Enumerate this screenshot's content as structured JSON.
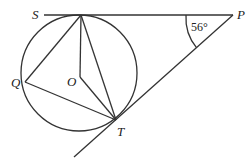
{
  "diagram": {
    "type": "circle-geometry",
    "points": {
      "S": "S",
      "P": "P",
      "Q": "Q",
      "O": "O",
      "T": "T"
    },
    "angle_label": "56°",
    "angle_at": "P",
    "segments": [
      "SP",
      "PT",
      "ST",
      "SQ",
      "QT",
      "SO",
      "OT"
    ],
    "colors": {
      "stroke": "#333333",
      "text": "#222222",
      "background": "#ffffff"
    }
  }
}
